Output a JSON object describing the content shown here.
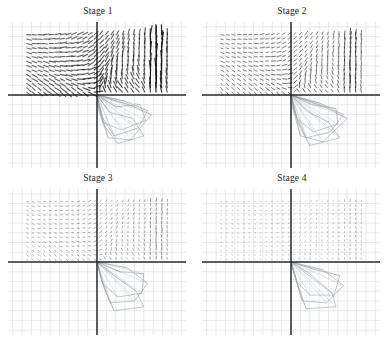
{
  "figure": {
    "layout": {
      "rows": 2,
      "cols": 2
    },
    "background": "#ffffff"
  },
  "panels": [
    {
      "id": "stage-1",
      "title": "Stage 1"
    },
    {
      "id": "stage-2",
      "title": "Stage 2"
    },
    {
      "id": "stage-3",
      "title": "Stage 3"
    },
    {
      "id": "stage-4",
      "title": "Stage 4"
    }
  ],
  "chart_data": {
    "type": "scatter",
    "subtitle": "",
    "xlabel": "",
    "ylabel": "",
    "grid": true,
    "legend": null,
    "panel_layout": {
      "rows": 2,
      "cols": 2
    },
    "axes": {
      "xlim": [
        -9.5,
        9.5
      ],
      "ylim": [
        -7.5,
        7.5
      ],
      "grid_spacing": 1,
      "origin": [
        0,
        0
      ],
      "x_axis_drawn": true,
      "y_axis_drawn": true
    },
    "colors": {
      "grid": "#d8dce2",
      "axis": "#2a2a2a",
      "vector": "#111111",
      "mesh": "#9aa0a6",
      "background": "#ffffff",
      "title": "#1a1a1a"
    },
    "panels": [
      {
        "name": "Stage 1",
        "type": "quiver",
        "description": "Dense convergent vortex spiraling into the origin; longest vectors, strongest swirl, long near-vertical strokes at right edge.",
        "vector_scale": 1.0,
        "vector_opacity": 1.0,
        "field": {
          "kind": "spiral-sink",
          "center": [
            0,
            0
          ],
          "rotation": "clockwise",
          "swirl": 1.0,
          "inflow": 1.0,
          "domain_x": [
            -7.5,
            7.5
          ],
          "domain_y": [
            0.3,
            6.2
          ],
          "nx": 26,
          "ny": 14,
          "edge_jet": {
            "x": 6.4,
            "strength": 1.0
          }
        },
        "mesh": {
          "visible": true,
          "polygons": [
            [
              [
                0,
                0
              ],
              [
                2.0,
                -1.2
              ],
              [
                4.6,
                -1.0
              ],
              [
                5.2,
                -2.6
              ],
              [
                2.6,
                -3.6
              ],
              [
                0.6,
                -2.8
              ]
            ],
            [
              [
                0,
                0
              ],
              [
                2.8,
                -0.6
              ],
              [
                5.4,
                -1.6
              ],
              [
                4.4,
                -3.4
              ],
              [
                1.8,
                -4.2
              ],
              [
                0.4,
                -2.0
              ]
            ],
            [
              [
                0,
                0
              ],
              [
                1.4,
                -1.8
              ],
              [
                3.8,
                -2.4
              ],
              [
                5.0,
                -4.2
              ],
              [
                2.2,
                -5.0
              ],
              [
                0.8,
                -3.2
              ]
            ],
            [
              [
                0,
                0
              ],
              [
                3.4,
                -1.0
              ],
              [
                5.8,
                -2.0
              ],
              [
                3.6,
                -4.6
              ],
              [
                1.2,
                -4.4
              ],
              [
                0.2,
                -1.6
              ]
            ]
          ]
        }
      },
      {
        "name": "Stage 2",
        "type": "quiver",
        "description": "Vortex persists but vectors are shorter and sparser; swirl centre shifted slightly right of origin.",
        "vector_scale": 0.68,
        "vector_opacity": 0.9,
        "field": {
          "kind": "spiral-sink",
          "center": [
            0.3,
            0.2
          ],
          "rotation": "clockwise",
          "swirl": 0.72,
          "inflow": 0.62,
          "domain_x": [
            -7.5,
            7.5
          ],
          "domain_y": [
            0.3,
            6.2
          ],
          "nx": 26,
          "ny": 14,
          "edge_jet": {
            "x": 6.4,
            "strength": 0.8
          }
        },
        "mesh": {
          "visible": true,
          "polygons": [
            [
              [
                0,
                0
              ],
              [
                2.2,
                -1.0
              ],
              [
                4.8,
                -1.4
              ],
              [
                5.0,
                -3.0
              ],
              [
                2.4,
                -3.8
              ],
              [
                0.6,
                -2.4
              ]
            ],
            [
              [
                0,
                0
              ],
              [
                3.0,
                -0.8
              ],
              [
                5.6,
                -2.0
              ],
              [
                4.2,
                -3.8
              ],
              [
                1.6,
                -4.4
              ],
              [
                0.4,
                -1.8
              ]
            ],
            [
              [
                0,
                0
              ],
              [
                1.6,
                -1.6
              ],
              [
                4.0,
                -2.8
              ],
              [
                5.2,
                -4.4
              ],
              [
                2.0,
                -5.2
              ],
              [
                0.8,
                -3.0
              ]
            ],
            [
              [
                0,
                0
              ],
              [
                3.6,
                -1.2
              ],
              [
                6.0,
                -2.4
              ],
              [
                3.4,
                -4.8
              ],
              [
                1.0,
                -4.2
              ],
              [
                0.2,
                -1.4
              ]
            ]
          ]
        }
      },
      {
        "name": "Stage 3",
        "type": "quiver",
        "description": "Field largely decayed to short stubs; faint residual rotation, a few longer vectors remain at the right edge.",
        "vector_scale": 0.42,
        "vector_opacity": 0.72,
        "field": {
          "kind": "spiral-sink",
          "center": [
            0.5,
            0.2
          ],
          "rotation": "clockwise",
          "swirl": 0.4,
          "inflow": 0.34,
          "domain_x": [
            -7.5,
            7.5
          ],
          "domain_y": [
            0.3,
            6.2
          ],
          "nx": 26,
          "ny": 14,
          "edge_jet": {
            "x": 6.4,
            "strength": 0.6
          }
        },
        "mesh": {
          "visible": true,
          "polygons": [
            [
              [
                0,
                0
              ],
              [
                2.4,
                -1.0
              ],
              [
                5.0,
                -1.2
              ],
              [
                4.8,
                -3.2
              ],
              [
                2.2,
                -3.6
              ],
              [
                0.6,
                -2.2
              ]
            ],
            [
              [
                0,
                0
              ],
              [
                3.2,
                -0.6
              ],
              [
                5.4,
                -2.2
              ],
              [
                4.0,
                -4.0
              ],
              [
                1.4,
                -4.2
              ],
              [
                0.4,
                -1.6
              ]
            ],
            [
              [
                0,
                0
              ],
              [
                1.8,
                -1.4
              ],
              [
                4.2,
                -3.0
              ],
              [
                5.0,
                -4.6
              ],
              [
                1.8,
                -5.0
              ],
              [
                0.8,
                -2.8
              ]
            ]
          ]
        }
      },
      {
        "name": "Stage 4",
        "type": "quiver",
        "description": "Weakest field; nearly uniform tiny stubs over the domain with a small cluster of longer vectors at upper right.",
        "vector_scale": 0.26,
        "vector_opacity": 0.6,
        "field": {
          "kind": "spiral-sink",
          "center": [
            0.6,
            0.2
          ],
          "rotation": "clockwise",
          "swirl": 0.22,
          "inflow": 0.18,
          "domain_x": [
            -7.5,
            7.5
          ],
          "domain_y": [
            0.3,
            6.2
          ],
          "nx": 26,
          "ny": 14,
          "edge_jet": {
            "x": 6.4,
            "strength": 0.45
          }
        },
        "mesh": {
          "visible": true,
          "polygons": [
            [
              [
                0,
                0
              ],
              [
                2.6,
                -0.8
              ],
              [
                5.2,
                -1.4
              ],
              [
                4.6,
                -3.4
              ],
              [
                2.0,
                -3.4
              ],
              [
                0.6,
                -2.0
              ]
            ],
            [
              [
                0,
                0
              ],
              [
                3.4,
                -0.8
              ],
              [
                5.6,
                -2.4
              ],
              [
                3.8,
                -4.2
              ],
              [
                1.2,
                -4.0
              ],
              [
                0.4,
                -1.4
              ]
            ],
            [
              [
                0,
                0
              ],
              [
                2.0,
                -1.2
              ],
              [
                4.4,
                -3.2
              ],
              [
                4.8,
                -4.6
              ],
              [
                1.6,
                -4.8
              ],
              [
                0.8,
                -2.6
              ]
            ]
          ]
        }
      }
    ]
  }
}
